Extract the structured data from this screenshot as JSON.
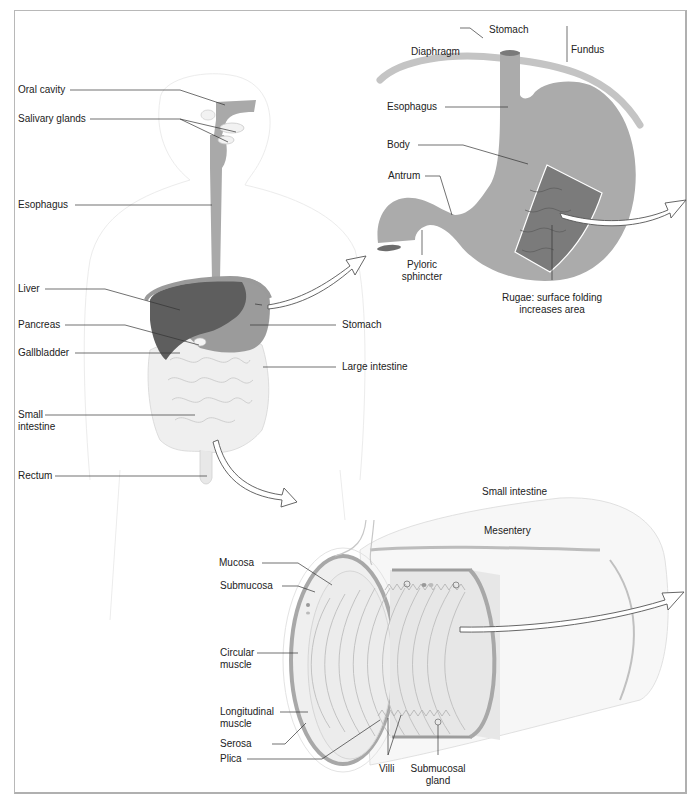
{
  "figure": {
    "panels": {
      "body": {
        "name": "Digestive tract overview",
        "labels": {
          "oral_cavity": "Oral cavity",
          "salivary_glands": "Salivary glands",
          "esophagus": "Esophagus",
          "liver": "Liver",
          "pancreas": "Pancreas",
          "gallbladder": "Gallbladder",
          "small_intestine_1": "Small",
          "small_intestine_2": "intestine",
          "rectum": "Rectum",
          "stomach": "Stomach",
          "large_intestine": "Large intestine"
        }
      },
      "stomach": {
        "title": "Stomach",
        "labels": {
          "diaphragm": "Diaphragm",
          "fundus": "Fundus",
          "esophagus": "Esophagus",
          "body": "Body",
          "antrum": "Antrum",
          "pyloric_1": "Pyloric",
          "pyloric_2": "sphincter",
          "rugae_1": "Rugae: surface folding",
          "rugae_2": "increases area"
        }
      },
      "small_intestine": {
        "title": "Small intestine",
        "labels": {
          "mesentery": "Mesentery",
          "mucosa": "Mucosa",
          "submucosa": "Submucosa",
          "circular_1": "Circular",
          "circular_2": "muscle",
          "longitudinal_1": "Longitudinal",
          "longitudinal_2": "muscle",
          "serosa": "Serosa",
          "plica": "Plica",
          "villi": "Villi",
          "submucosal_1": "Submucosal",
          "submucosal_2": "gland"
        }
      }
    },
    "colors": {
      "organ_gray": "#a9a9a9",
      "liver_dark": "#5e5e5e",
      "stomach_mid": "#9a9a9a",
      "intestine_light": "#ececec",
      "rugae": "#7a7a7a",
      "outline": "#b8b8b8",
      "text": "#222222"
    }
  }
}
